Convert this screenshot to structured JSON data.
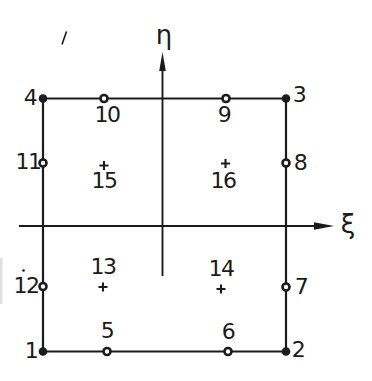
{
  "figure": {
    "kind": "finite-element-node-diagram",
    "colors": {
      "ink": "#1b1b1b",
      "background": "#ffffff",
      "scan_artifact": "#c9c9c9"
    },
    "axes": {
      "vertical_label": "η",
      "horizontal_label": "ξ"
    },
    "markers": {
      "corner_node": "filled-dot",
      "mid_edge_node": "open-circle",
      "interior_node": "plus-cross"
    },
    "nodes": [
      {
        "id": "1",
        "type": "corner"
      },
      {
        "id": "2",
        "type": "corner"
      },
      {
        "id": "3",
        "type": "corner"
      },
      {
        "id": "4",
        "type": "corner"
      },
      {
        "id": "5",
        "type": "mid-edge"
      },
      {
        "id": "6",
        "type": "mid-edge"
      },
      {
        "id": "7",
        "type": "mid-edge"
      },
      {
        "id": "8",
        "type": "mid-edge"
      },
      {
        "id": "9",
        "type": "mid-edge"
      },
      {
        "id": "10",
        "type": "mid-edge"
      },
      {
        "id": "11",
        "type": "mid-edge"
      },
      {
        "id": "12",
        "type": "mid-edge"
      },
      {
        "id": "13",
        "type": "interior"
      },
      {
        "id": "14",
        "type": "interior"
      },
      {
        "id": "15",
        "type": "interior"
      },
      {
        "id": "16",
        "type": "interior"
      }
    ]
  }
}
